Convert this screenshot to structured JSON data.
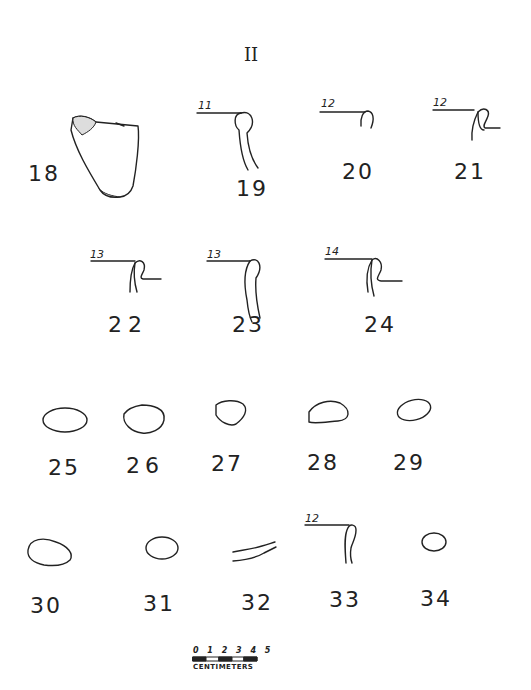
{
  "plate": {
    "title": "II"
  },
  "figures": [
    {
      "id": "18",
      "label": "18",
      "type": "sherd-body"
    },
    {
      "id": "19",
      "label": "19",
      "type": "rim-profile",
      "diameter": "11"
    },
    {
      "id": "20",
      "label": "20",
      "type": "rim-profile",
      "diameter": "12"
    },
    {
      "id": "21",
      "label": "21",
      "type": "rim-profile",
      "diameter": "12"
    },
    {
      "id": "22",
      "label": "22",
      "type": "rim-profile",
      "diameter": "13"
    },
    {
      "id": "23",
      "label": "23",
      "type": "rim-profile",
      "diameter": "13"
    },
    {
      "id": "24",
      "label": "24",
      "type": "rim-profile",
      "diameter": "14"
    },
    {
      "id": "25",
      "label": "25",
      "type": "section"
    },
    {
      "id": "26",
      "label": "26",
      "type": "section"
    },
    {
      "id": "27",
      "label": "27",
      "type": "section"
    },
    {
      "id": "28",
      "label": "28",
      "type": "section"
    },
    {
      "id": "29",
      "label": "29",
      "type": "section"
    },
    {
      "id": "30",
      "label": "30",
      "type": "section"
    },
    {
      "id": "31",
      "label": "31",
      "type": "section"
    },
    {
      "id": "32",
      "label": "32",
      "type": "section"
    },
    {
      "id": "33",
      "label": "33",
      "type": "rim-profile",
      "diameter": "12"
    },
    {
      "id": "34",
      "label": "34",
      "type": "section"
    }
  ],
  "scale": {
    "ticks": "0 1 2 3 4 5",
    "unit": "CENTIMETERS"
  }
}
